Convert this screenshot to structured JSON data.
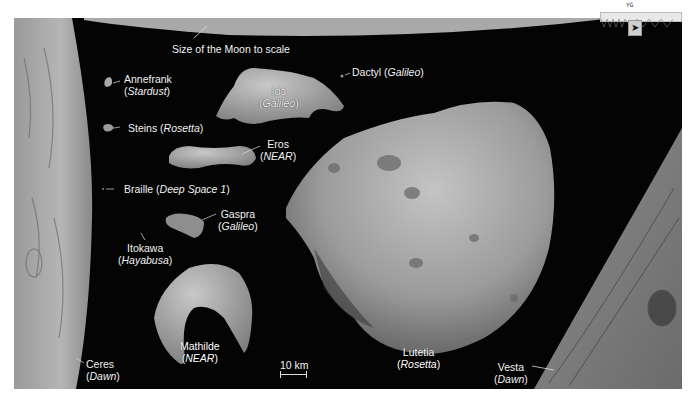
{
  "figure": {
    "moon_caption": "Size of the Moon to scale",
    "scale_bar": {
      "label": "10 km"
    },
    "asteroids": [
      {
        "name": "Annefrank",
        "mission": "Stardust"
      },
      {
        "name": "Ida",
        "mission": "Galileo"
      },
      {
        "name": "Dactyl",
        "mission": "Galileo"
      },
      {
        "name": "Steins",
        "mission": "Rosetta"
      },
      {
        "name": "Eros",
        "mission": "NEAR"
      },
      {
        "name": "Braille",
        "mission": "Deep Space 1"
      },
      {
        "name": "Gaspra",
        "mission": "Galileo"
      },
      {
        "name": "Itokawa",
        "mission": "Hayabusa"
      },
      {
        "name": "Mathilde",
        "mission": "NEAR"
      },
      {
        "name": "Lutetia",
        "mission": "Rosetta"
      },
      {
        "name": "Ceres",
        "mission": "Dawn"
      },
      {
        "name": "Vesta",
        "mission": "Dawn"
      }
    ],
    "colors": {
      "space": "#040404",
      "moon": "#a9a9a9",
      "rock_light": "#b8b8b8",
      "rock_mid": "#8c8c8c",
      "rock_dark": "#5a5a5a",
      "label": "#f2f2f2"
    }
  },
  "widget": {
    "label": "YG",
    "tool_icon": "satellite-icon"
  }
}
